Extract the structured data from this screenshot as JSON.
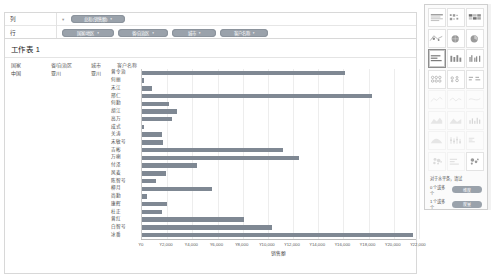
{
  "shelves": {
    "columns": {
      "label": "列",
      "caret": "▾",
      "pills": [
        {
          "text": "总和(销售额)",
          "caret": "▾"
        }
      ]
    },
    "rows": {
      "label": "行",
      "pills": [
        {
          "text": "国家/地区",
          "caret": "▾"
        },
        {
          "text": "省/自治区",
          "caret": "▾"
        },
        {
          "text": "城市",
          "caret": "▾"
        },
        {
          "text": "客户名称",
          "caret": "▾"
        }
      ]
    }
  },
  "sheet": {
    "title": "工作表 1",
    "columns": [
      "国家",
      "省/自治区",
      "城市",
      "客户名称"
    ],
    "dimension_values": {
      "country": "中国",
      "province": "亚川",
      "city": "亚川"
    }
  },
  "chart_data": {
    "type": "bar",
    "orientation": "horizontal",
    "title": "工作表 1",
    "xlabel": "销售额",
    "ylabel": "客户名称",
    "xlim": [
      0,
      22000
    ],
    "xticks": [
      "¥0",
      "¥2,000",
      "¥4,000",
      "¥6,000",
      "¥8,000",
      "¥10,000",
      "¥12,000",
      "¥14,000",
      "¥16,000",
      "¥18,000",
      "¥20,000",
      "¥22,000"
    ],
    "grid": true,
    "legend": "none",
    "bar_color": "#7f8893",
    "categories": [
      "曾令治",
      "何丽",
      "宋江",
      "邢仁",
      "何勤",
      "胡江",
      "高万",
      "成式",
      "关涛",
      "宋敏号",
      "吉彬",
      "万喇",
      "付泽",
      "风麦",
      "陈智号",
      "柳月",
      "尚勤",
      "康辉",
      "杜正",
      "曾红",
      "白智号",
      "冰番"
    ],
    "values": [
      16100,
      150,
      780,
      18300,
      2150,
      2800,
      2400,
      180,
      1600,
      1700,
      11200,
      12500,
      4400,
      1900,
      1100,
      5550,
      400,
      2000,
      1550,
      8100,
      10300,
      21500
    ]
  },
  "show_me": {
    "charts": [
      "text-table-icon",
      "heat-map-icon",
      "highlight-table-icon",
      "symbol-map-icon",
      "filled-map-icon",
      "pie-chart-icon",
      "horizontal-bar-icon",
      "stacked-bar-icon",
      "side-by-side-bar-icon",
      "treemap-icon",
      "circle-view-icon",
      "side-by-side-circle-icon",
      "line-continuous-icon",
      "line-discrete-icon",
      "dual-line-icon",
      "area-continuous-icon",
      "area-discrete-icon",
      "dual-combination-icon",
      "scatter-plot-icon",
      "histogram-icon",
      "box-and-whisker-icon",
      "gantt-icon",
      "bullet-graph-icon",
      "packed-bubbles-icon"
    ],
    "selected": "horizontal-bar-icon",
    "hint": "对于水平条，请试",
    "requirements": [
      {
        "text": "0 个或多个",
        "pill": "维度"
      },
      {
        "text": "1 个或多个",
        "pill": "度量"
      }
    ]
  }
}
